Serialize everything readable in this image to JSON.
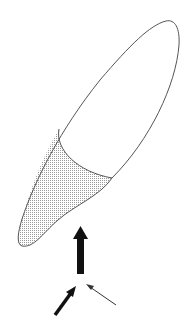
{
  "diagram": {
    "colors": {
      "outline": "#555555",
      "shade": "#b8b8b8",
      "arrow": "#111111",
      "background": "#ffffff"
    },
    "elements": [
      {
        "name": "tooth-outline"
      },
      {
        "name": "shaded-region"
      },
      {
        "name": "vertical-force-arrow",
        "weight": "thick"
      },
      {
        "name": "left-oblique-arrow",
        "weight": "medium"
      },
      {
        "name": "right-oblique-arrow",
        "weight": "thin"
      }
    ]
  }
}
